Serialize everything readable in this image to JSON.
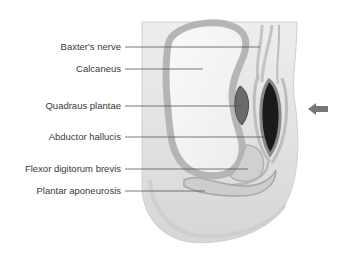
{
  "figure": {
    "labels": [
      {
        "id": "baxters-nerve",
        "text": "Baxter's nerve",
        "y": 47,
        "end_x": 260
      },
      {
        "id": "calcaneus",
        "text": "Calcaneus",
        "y": 69,
        "end_x": 203
      },
      {
        "id": "quadraus-plantae",
        "text": "Quadraus plantae",
        "y": 106,
        "end_x": 243
      },
      {
        "id": "abductor-hallucis",
        "text": "Abductor hallucis",
        "y": 137,
        "end_x": 265
      },
      {
        "id": "flexor-digitorum-brevis",
        "text": "Flexor digitorum brevis",
        "y": 169,
        "end_x": 248
      },
      {
        "id": "plantar-aponeurosis",
        "text": "Plantar aponeurosis",
        "y": 191,
        "end_x": 205
      }
    ],
    "indicator": {
      "icon": "arrow-left-icon",
      "color": "#777777"
    },
    "colors": {
      "soft_tissue": "#e4e4e4",
      "bone_cortex": "#b8b8b8",
      "bone_marrow": "#f6f6f6",
      "muscle_dark": "#1a1a1a",
      "leader_line": "#555555",
      "text": "#3a3a3a"
    }
  }
}
